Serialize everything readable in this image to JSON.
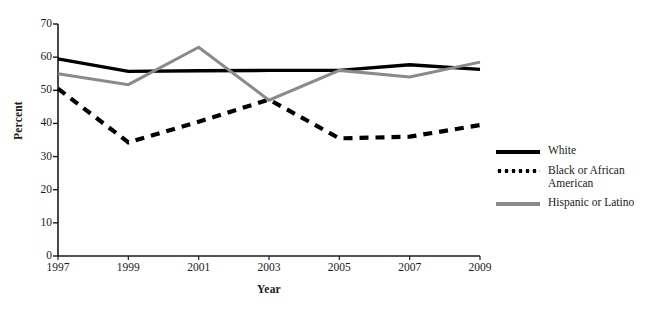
{
  "chart_data": {
    "type": "line",
    "title": "",
    "xlabel": "Year",
    "ylabel": "Percent",
    "categories": [
      1997,
      1999,
      2001,
      2003,
      2005,
      2007,
      2009
    ],
    "xtick_labels": [
      "1997",
      "1999",
      "2001",
      "2003",
      "2005",
      "2007",
      "2009"
    ],
    "ytick_labels": [
      "0",
      "10",
      "20",
      "30",
      "40",
      "50",
      "60",
      "70"
    ],
    "ytick_values": [
      0,
      10,
      20,
      30,
      40,
      50,
      60,
      70
    ],
    "xlim": [
      1997,
      2009
    ],
    "ylim": [
      0,
      70
    ],
    "grid": false,
    "legend_position": "right",
    "series": [
      {
        "name": "White",
        "color": "#000000",
        "style": "solid",
        "values": [
          59.5,
          55.7,
          55.9,
          56.0,
          56.0,
          57.7,
          56.3
        ]
      },
      {
        "name": "Black or African American",
        "color": "#000000",
        "style": "dotted",
        "values": [
          50.5,
          34.3,
          40.5,
          47.2,
          35.5,
          36.0,
          39.5
        ]
      },
      {
        "name": "Hispanic or Latino",
        "color": "#8a8a8a",
        "style": "solid",
        "values": [
          55.0,
          51.7,
          63.0,
          47.0,
          56.0,
          54.0,
          58.5
        ]
      }
    ]
  },
  "legend": {
    "entries": [
      {
        "label": "White",
        "swatch": "solid-black"
      },
      {
        "label": "Black or African\nAmerican",
        "swatch": "dotted-black"
      },
      {
        "label": "Hispanic or Latino",
        "swatch": "solid-gray"
      }
    ]
  },
  "axes": {
    "y_title": "Percent",
    "x_title": "Year"
  },
  "colors": {
    "white_series": "#000000",
    "black_series": "#000000",
    "hispanic_series": "#8a8a8a",
    "axis": "#1a1a1a",
    "background": "#ffffff"
  }
}
